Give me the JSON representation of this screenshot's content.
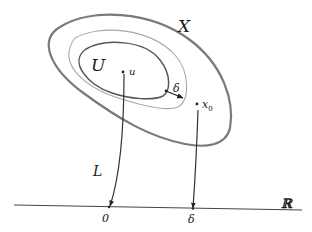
{
  "diagram": {
    "labels": {
      "space": "X",
      "set": "U",
      "point_u": "u",
      "point_x0_base": "x",
      "point_x0_sub": "0",
      "delta_gap": "δ",
      "map": "L",
      "axis": "ℝ",
      "axis_zero": "0",
      "axis_delta": "δ"
    },
    "colors": {
      "outer_curve": "#7a7a7a",
      "middle_curve": "#a8a8a8",
      "inner_curve": "#555555",
      "lines": "#333333",
      "text": "#1a1a1a"
    }
  }
}
